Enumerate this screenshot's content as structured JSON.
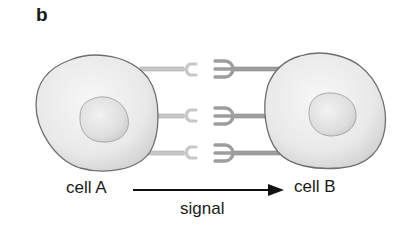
{
  "figure": {
    "panel_label": "b",
    "cells": [
      {
        "id": "A",
        "label": "cell A",
        "role": "sender",
        "ligand_shape": "fork-2-prong",
        "ligand_color": "#c8c8c8"
      },
      {
        "id": "B",
        "label": "cell B",
        "role": "receiver",
        "receptor_shape": "fork-3-prong",
        "receptor_color": "#9e9e9e"
      }
    ],
    "connectors_count": 3,
    "arrow": {
      "from": "cell A",
      "to": "cell B",
      "label": "signal"
    },
    "colors": {
      "cell_fill": "#e8e8e8",
      "cell_outline": "#6e6e6e",
      "nucleus_fill": "#dcdcdc",
      "ligand": "#c8c8c8",
      "receptor": "#9e9e9e",
      "arrow": "#111111"
    }
  }
}
